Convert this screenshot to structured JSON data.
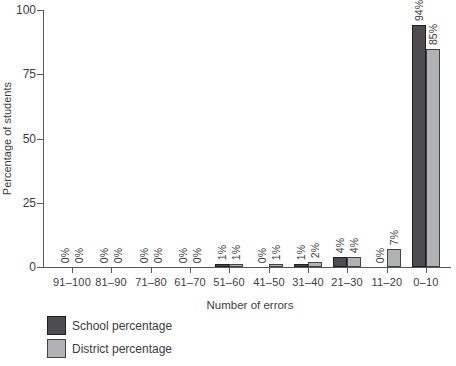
{
  "figure": {
    "background": "#ffffff",
    "axis_color": "#59595b",
    "text_color": "#3c3c3e"
  },
  "chart_data": {
    "type": "bar",
    "title": "",
    "xlabel": "Number of errors",
    "ylabel": "Percentage of students",
    "categories": [
      "91–100",
      "81–90",
      "71–80",
      "61–70",
      "51–60",
      "41–50",
      "31–40",
      "21–30",
      "11–20",
      "0–10"
    ],
    "series": [
      {
        "name": "School percentage",
        "color": "#4d4d4f",
        "border_color": "#1e1e20",
        "values": [
          0,
          0,
          0,
          0,
          1,
          0,
          1,
          4,
          0,
          94
        ],
        "labels": [
          "0%",
          "0%",
          "0%",
          "0%",
          "1%",
          "0%",
          "1%",
          "4%",
          "0%",
          "94%"
        ]
      },
      {
        "name": "District percentage",
        "color": "#b1b2b4",
        "border_color": "#424244",
        "values": [
          0,
          0,
          0,
          0,
          1,
          1,
          2,
          4,
          7,
          85
        ],
        "labels": [
          "0%",
          "0%",
          "0%",
          "0%",
          "1%",
          "1%",
          "2%",
          "4%",
          "7%",
          "85%"
        ]
      }
    ],
    "yticks": [
      0,
      25,
      50,
      75,
      100
    ],
    "ylim": [
      0,
      100
    ],
    "grid": false,
    "legend_position": "bottom-left",
    "value_label_rotation": -90
  },
  "legend": {
    "items": [
      {
        "label": "School percentage"
      },
      {
        "label": "District percentage"
      }
    ]
  }
}
